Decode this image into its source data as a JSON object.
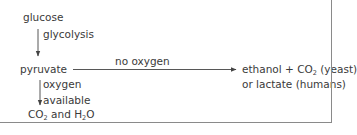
{
  "diagram": {
    "type": "flow",
    "nodes": {
      "glucose": "glucose",
      "pyruvate": "pyruvate",
      "fermentation_line1_prefix": "ethanol + CO",
      "fermentation_line1_sub": "2",
      "fermentation_line1_suffix": " (yeast)",
      "fermentation_line2": "or lactate (humans)",
      "aerobic_co2": "CO",
      "aerobic_co2_sub": "2",
      "aerobic_and": " and H",
      "aerobic_h2_sub": "2",
      "aerobic_o": "O"
    },
    "edges": {
      "glucose_to_pyruvate": "glycolysis",
      "pyruvate_to_fermentation": "no oxygen",
      "pyruvate_to_aerobic_line1": "oxygen",
      "pyruvate_to_aerobic_line2": "available"
    },
    "colors": {
      "text": "#3a3a3a",
      "arrow": "#444444",
      "border": "#8a8a8a"
    }
  }
}
